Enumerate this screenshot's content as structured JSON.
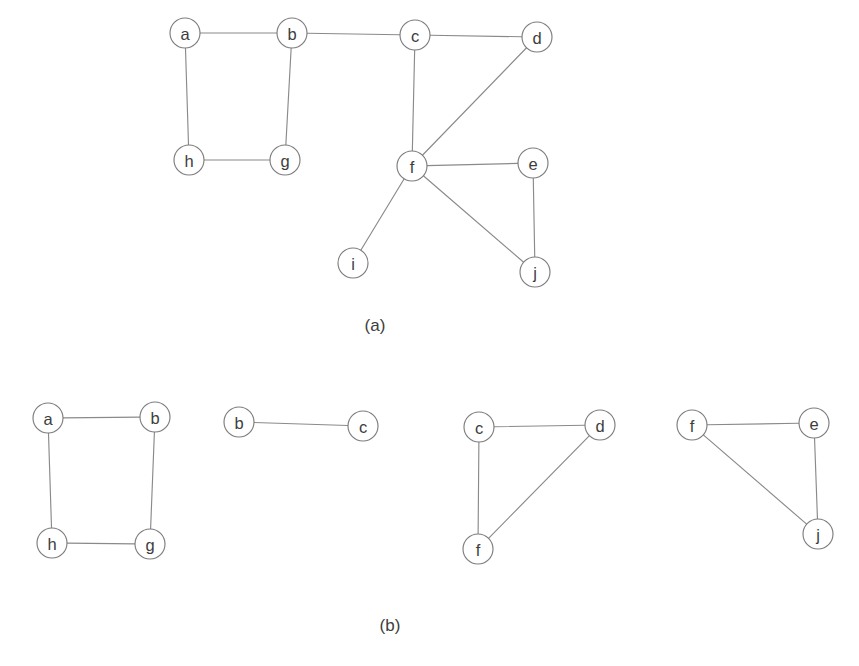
{
  "figure": {
    "background_color": "#ffffff",
    "edge_color": "#8a8a8a",
    "node_stroke_color": "#7d7d7d",
    "node_fill_color": "#ffffff",
    "label_color": "#3d3d3d",
    "node_radius": 15
  },
  "panels": [
    {
      "id": "panel-a",
      "caption": "(a)",
      "caption_x": 375,
      "caption_y": 325,
      "description": "Original undirected graph with ten vertices",
      "nodes": [
        {
          "id": "a",
          "label": "a",
          "x": 185,
          "y": 33
        },
        {
          "id": "b",
          "label": "b",
          "x": 292,
          "y": 33
        },
        {
          "id": "c",
          "label": "c",
          "x": 415,
          "y": 35
        },
        {
          "id": "d",
          "label": "d",
          "x": 537,
          "y": 37
        },
        {
          "id": "e",
          "label": "e",
          "x": 533,
          "y": 163
        },
        {
          "id": "f",
          "label": "f",
          "x": 412,
          "y": 166
        },
        {
          "id": "g",
          "label": "g",
          "x": 285,
          "y": 160
        },
        {
          "id": "h",
          "label": "h",
          "x": 189,
          "y": 160
        },
        {
          "id": "i",
          "label": "i",
          "x": 353,
          "y": 263
        },
        {
          "id": "j",
          "label": "j",
          "x": 535,
          "y": 272
        }
      ],
      "edges": [
        {
          "from": "a",
          "to": "b"
        },
        {
          "from": "b",
          "to": "c"
        },
        {
          "from": "c",
          "to": "d"
        },
        {
          "from": "a",
          "to": "h"
        },
        {
          "from": "b",
          "to": "g"
        },
        {
          "from": "h",
          "to": "g"
        },
        {
          "from": "c",
          "to": "f"
        },
        {
          "from": "d",
          "to": "f"
        },
        {
          "from": "f",
          "to": "e"
        },
        {
          "from": "f",
          "to": "i"
        },
        {
          "from": "f",
          "to": "j"
        },
        {
          "from": "e",
          "to": "j"
        }
      ]
    },
    {
      "id": "panel-b",
      "caption": "(b)",
      "caption_x": 390,
      "caption_y": 625,
      "description": "The graph decomposed into four biconnected components",
      "subgraphs": [
        {
          "id": "subgraph-1",
          "nodes": [
            {
              "id": "a",
              "label": "a",
              "x": 48,
              "y": 418
            },
            {
              "id": "b",
              "label": "b",
              "x": 155,
              "y": 417
            },
            {
              "id": "h",
              "label": "h",
              "x": 52,
              "y": 543
            },
            {
              "id": "g",
              "label": "g",
              "x": 150,
              "y": 544
            }
          ],
          "edges": [
            {
              "from": "a",
              "to": "b"
            },
            {
              "from": "a",
              "to": "h"
            },
            {
              "from": "b",
              "to": "g"
            },
            {
              "from": "h",
              "to": "g"
            }
          ]
        },
        {
          "id": "subgraph-2",
          "nodes": [
            {
              "id": "b",
              "label": "b",
              "x": 239,
              "y": 422
            },
            {
              "id": "c",
              "label": "c",
              "x": 363,
              "y": 426
            }
          ],
          "edges": [
            {
              "from": "b",
              "to": "c"
            }
          ]
        },
        {
          "id": "subgraph-3",
          "nodes": [
            {
              "id": "c",
              "label": "c",
              "x": 479,
              "y": 427
            },
            {
              "id": "d",
              "label": "d",
              "x": 600,
              "y": 425
            },
            {
              "id": "f",
              "label": "f",
              "x": 478,
              "y": 549
            }
          ],
          "edges": [
            {
              "from": "c",
              "to": "d"
            },
            {
              "from": "c",
              "to": "f"
            },
            {
              "from": "d",
              "to": "f"
            }
          ]
        },
        {
          "id": "subgraph-4",
          "nodes": [
            {
              "id": "f",
              "label": "f",
              "x": 692,
              "y": 425
            },
            {
              "id": "e",
              "label": "e",
              "x": 814,
              "y": 423
            },
            {
              "id": "j",
              "label": "j",
              "x": 818,
              "y": 534
            }
          ],
          "edges": [
            {
              "from": "f",
              "to": "e"
            },
            {
              "from": "f",
              "to": "j"
            },
            {
              "from": "e",
              "to": "j"
            }
          ]
        }
      ]
    }
  ]
}
